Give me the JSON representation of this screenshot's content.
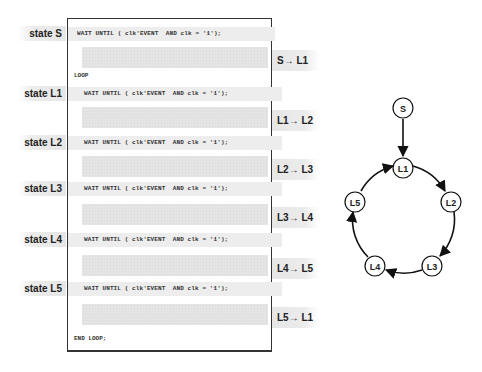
{
  "code": {
    "wait_statement": "WAIT UNTIL ( clk'EVENT  AND clk = '1');",
    "loop_start": "LOOP",
    "loop_end": "END LOOP;"
  },
  "states": [
    {
      "label": "state S"
    },
    {
      "label": "state L1"
    },
    {
      "label": "state L2"
    },
    {
      "label": "state L3"
    },
    {
      "label": "state L4"
    },
    {
      "label": "state L5"
    }
  ],
  "transitions": [
    {
      "label": "S→ L1"
    },
    {
      "label": "L1→ L2"
    },
    {
      "label": "L2→ L3"
    },
    {
      "label": "L3→ L4"
    },
    {
      "label": "L4→ L5"
    },
    {
      "label": "L5→ L1"
    }
  ],
  "diagram": {
    "nodes": [
      {
        "id": "S",
        "label": "S"
      },
      {
        "id": "L1",
        "label": "L1"
      },
      {
        "id": "L2",
        "label": "L2"
      },
      {
        "id": "L3",
        "label": "L3"
      },
      {
        "id": "L4",
        "label": "L4"
      },
      {
        "id": "L5",
        "label": "L5"
      }
    ],
    "edges": [
      {
        "from": "S",
        "to": "L1"
      },
      {
        "from": "L1",
        "to": "L2"
      },
      {
        "from": "L2",
        "to": "L3"
      },
      {
        "from": "L3",
        "to": "L4"
      },
      {
        "from": "L4",
        "to": "L5"
      },
      {
        "from": "L5",
        "to": "L1"
      }
    ]
  }
}
